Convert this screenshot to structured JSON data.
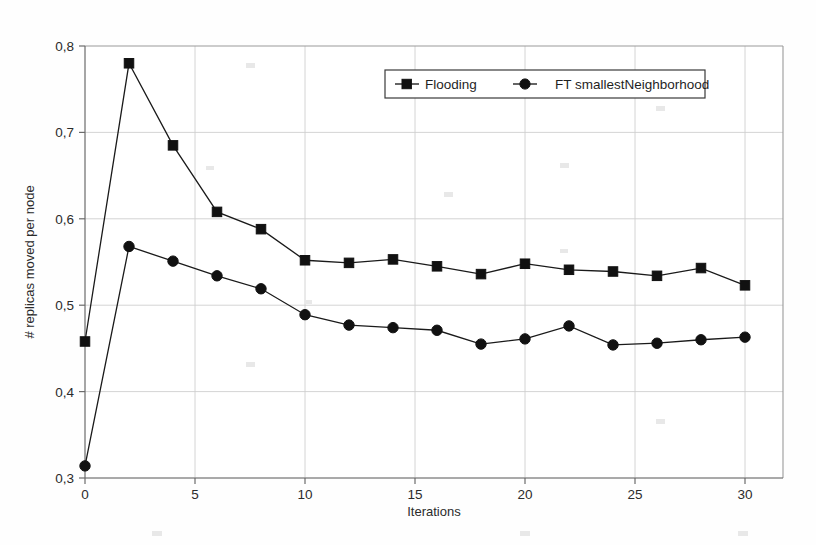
{
  "chart_data": {
    "type": "line",
    "title": "",
    "xlabel": "Iterations",
    "ylabel": "# replicas moved per node",
    "xlim": [
      0,
      31
    ],
    "ylim": [
      0.3,
      0.8
    ],
    "grid": true,
    "legend_position": "top-center",
    "decimal_separator": ",",
    "x": [
      0,
      2,
      4,
      6,
      8,
      10,
      12,
      14,
      16,
      18,
      20,
      22,
      24,
      26,
      28,
      30
    ],
    "xticks": [
      "0",
      "5",
      "10",
      "15",
      "20",
      "25",
      "30"
    ],
    "xtick_values": [
      0,
      5,
      10,
      15,
      20,
      25,
      30
    ],
    "yticks": [
      "0,3",
      "0,4",
      "0,5",
      "0,6",
      "0,7",
      "0,8"
    ],
    "ytick_values": [
      0.3,
      0.4,
      0.5,
      0.6,
      0.7,
      0.8
    ],
    "series": [
      {
        "name": "Flooding",
        "marker": "square",
        "color": "#111111",
        "values": [
          0.458,
          0.78,
          0.685,
          0.608,
          0.588,
          0.552,
          0.549,
          0.553,
          0.545,
          0.536,
          0.548,
          0.541,
          0.539,
          0.534,
          0.543,
          0.523
        ]
      },
      {
        "name": "FT smallestNeighborhood",
        "marker": "circle",
        "color": "#111111",
        "values": [
          0.314,
          0.568,
          0.551,
          0.534,
          0.519,
          0.489,
          0.477,
          0.474,
          0.471,
          0.455,
          0.461,
          0.476,
          0.454,
          0.456,
          0.46,
          0.463
        ]
      }
    ]
  },
  "legend": {
    "entries": [
      {
        "label": "Flooding",
        "marker": "square"
      },
      {
        "label": "FT smallestNeighborhood",
        "marker": "circle"
      }
    ]
  },
  "axes": {
    "x_title": "Iterations",
    "y_title": "# replicas moved per node"
  }
}
